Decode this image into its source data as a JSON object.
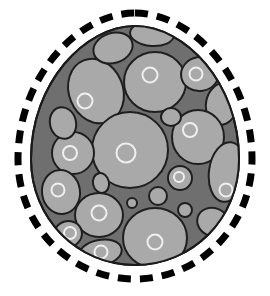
{
  "figure": {
    "canvas": {
      "width": 270,
      "height": 296,
      "background": "#ffffff"
    },
    "colors": {
      "background": "#ffffff",
      "dashed_outline": "#000000",
      "body_fill": "#6f6f6f",
      "body_stroke": "#1a1a1a",
      "cell_fill": "#a9a9a9",
      "cell_stroke": "#1f1f1f",
      "nucleus_stroke": "#efefef",
      "nucleus_fill": "#a9a9a9"
    },
    "dashed_outline": {
      "name": "dashed-egg-outline",
      "stroke_width": 7,
      "dash_length": 13,
      "dash_gap": 9,
      "path": "M 135 13 C 191 13 252 76 252 159 C 252 226 200 279 135 279 C 70 279 18 226 18 159 C 18 76 79 13 135 13 Z"
    },
    "body": {
      "name": "egg-body",
      "stroke_width": 2,
      "path": "M 135 26 C 185 26 239 83 239 159 C 239 219 192 265 135 265 C 78 265 31 219 31 159 C 31 83 85 26 135 26 Z"
    },
    "cells": [
      {
        "id": "cell-01",
        "cx": 96,
        "cy": 91,
        "rx": 27,
        "ry": 33,
        "rot": -22,
        "nucleus": {
          "cx": 85,
          "cy": 101,
          "r": 7.5
        }
      },
      {
        "id": "cell-02",
        "cx": 113,
        "cy": 48,
        "rx": 20,
        "ry": 15,
        "rot": -18,
        "nucleus": null
      },
      {
        "id": "cell-03",
        "cx": 152,
        "cy": 34,
        "rx": 22,
        "ry": 12,
        "rot": 4,
        "nucleus": null
      },
      {
        "id": "cell-04",
        "cx": 155,
        "cy": 82,
        "rx": 31,
        "ry": 30,
        "rot": 0,
        "nucleus": {
          "cx": 150,
          "cy": 75,
          "r": 7.5
        }
      },
      {
        "id": "cell-05",
        "cx": 200,
        "cy": 74,
        "rx": 19,
        "ry": 17,
        "rot": -10,
        "nucleus": {
          "cx": 196,
          "cy": 74,
          "r": 6.5
        }
      },
      {
        "id": "cell-06",
        "cx": 222,
        "cy": 104,
        "rx": 16,
        "ry": 21,
        "rot": 10,
        "nucleus": null
      },
      {
        "id": "cell-07",
        "cx": 130,
        "cy": 150,
        "rx": 38,
        "ry": 38,
        "rot": 0,
        "nucleus": {
          "cx": 126,
          "cy": 153,
          "r": 9.5
        }
      },
      {
        "id": "cell-08",
        "cx": 198,
        "cy": 137,
        "rx": 26,
        "ry": 27,
        "rot": 0,
        "nucleus": {
          "cx": 190,
          "cy": 130,
          "r": 7
        }
      },
      {
        "id": "cell-09",
        "cx": 73,
        "cy": 153,
        "rx": 21,
        "ry": 21,
        "rot": 0,
        "nucleus": {
          "cx": 70,
          "cy": 153,
          "r": 7
        }
      },
      {
        "id": "cell-10",
        "cx": 61,
        "cy": 192,
        "rx": 19,
        "ry": 22,
        "rot": -8,
        "nucleus": {
          "cx": 58,
          "cy": 190,
          "r": 6.5
        }
      },
      {
        "id": "cell-11",
        "cx": 101,
        "cy": 183,
        "rx": 8,
        "ry": 10,
        "rot": -12,
        "nucleus": null
      },
      {
        "id": "cell-12",
        "cx": 180,
        "cy": 178,
        "rx": 12,
        "ry": 12,
        "rot": 0,
        "nucleus": {
          "cx": 179,
          "cy": 177,
          "r": 5
        }
      },
      {
        "id": "cell-13",
        "cx": 227,
        "cy": 172,
        "rx": 18,
        "ry": 30,
        "rot": 8,
        "nucleus": {
          "cx": 226,
          "cy": 190,
          "r": 6.5
        }
      },
      {
        "id": "cell-14",
        "cx": 158,
        "cy": 196,
        "rx": 9,
        "ry": 9,
        "rot": 0,
        "nucleus": null
      },
      {
        "id": "cell-15",
        "cx": 132,
        "cy": 203,
        "rx": 5,
        "ry": 5,
        "rot": 0,
        "nucleus": null
      },
      {
        "id": "cell-16",
        "cx": 185,
        "cy": 210,
        "rx": 7,
        "ry": 7,
        "rot": 0,
        "nucleus": null
      },
      {
        "id": "cell-17",
        "cx": 99,
        "cy": 215,
        "rx": 24,
        "ry": 22,
        "rot": 0,
        "nucleus": {
          "cx": 99,
          "cy": 213,
          "r": 7.5
        }
      },
      {
        "id": "cell-18",
        "cx": 155,
        "cy": 238,
        "rx": 32,
        "ry": 30,
        "rot": 0,
        "nucleus": {
          "cx": 155,
          "cy": 242,
          "r": 7.5
        }
      },
      {
        "id": "cell-19",
        "cx": 68,
        "cy": 234,
        "rx": 14,
        "ry": 13,
        "rot": -15,
        "nucleus": {
          "cx": 70,
          "cy": 233,
          "r": 6
        }
      },
      {
        "id": "cell-20",
        "cx": 100,
        "cy": 253,
        "rx": 22,
        "ry": 13,
        "rot": -12,
        "nucleus": {
          "cx": 101,
          "cy": 252,
          "r": 6.5
        }
      },
      {
        "id": "cell-21",
        "cx": 213,
        "cy": 222,
        "rx": 16,
        "ry": 14,
        "rot": 20,
        "nucleus": null
      },
      {
        "id": "cell-22",
        "cx": 63,
        "cy": 123,
        "rx": 13,
        "ry": 16,
        "rot": -14,
        "nucleus": null
      },
      {
        "id": "cell-23",
        "cx": 171,
        "cy": 117,
        "rx": 10,
        "ry": 9,
        "rot": 0,
        "nucleus": null
      }
    ]
  }
}
